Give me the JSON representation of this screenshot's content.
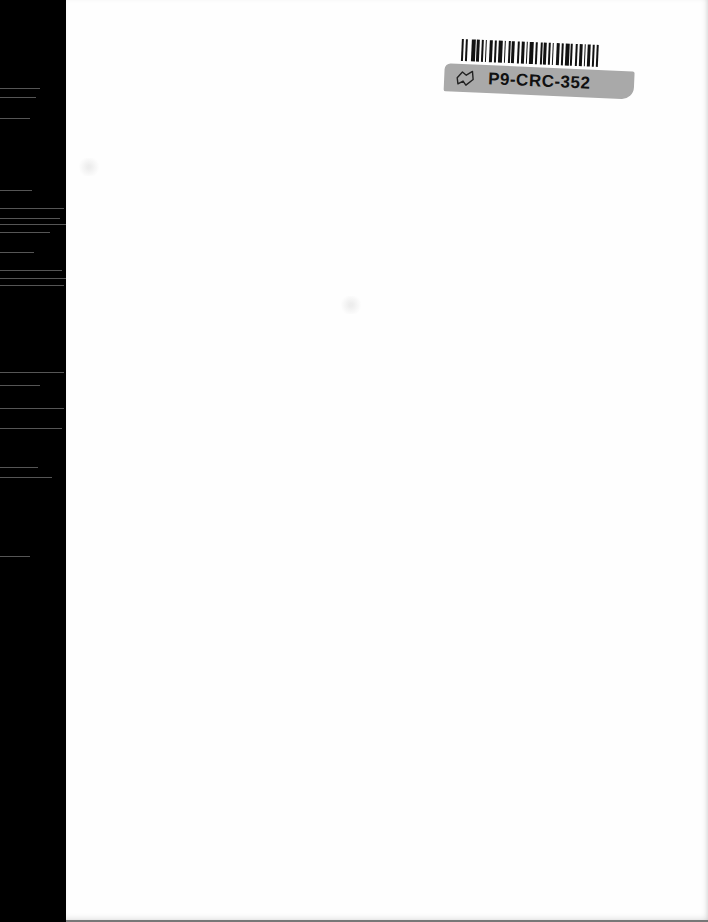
{
  "document": {
    "type": "scanned blank page",
    "sticker": {
      "label": "P9-CRC-352",
      "icon": "flag-outline-icon",
      "band_color": "#a9a9a9",
      "barcode_color": "#111111"
    },
    "scan_edge_color": "#000000",
    "page_color": "#fefefe"
  }
}
